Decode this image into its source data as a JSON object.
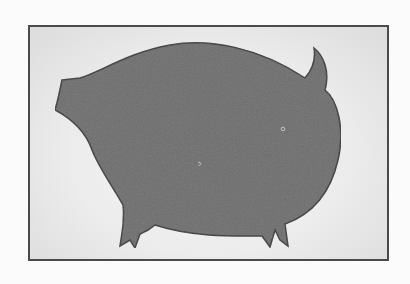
{
  "figure": {
    "caption": "",
    "colors": {
      "background": "#fbfbfb",
      "frame_border": "#4a4a4a",
      "frame_fill": "#e8e8e8",
      "silhouette_fill": "#6e6e6e",
      "silhouette_outline": "#3a3a3a"
    }
  }
}
